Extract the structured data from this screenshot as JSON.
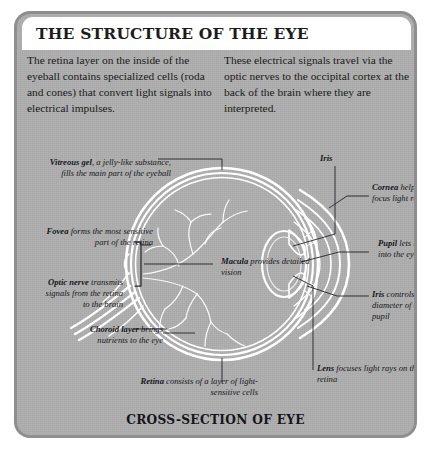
{
  "panel": {
    "title": "THE STRUCTURE OF THE EYE",
    "caption": "CROSS-SECTION OF EYE",
    "bg_color": "#a8a8a8",
    "border_color": "#8e8e8e",
    "title_bar_color": "#ffffff",
    "text_color": "#1a1a1a",
    "diagram_line_color": "#ffffff"
  },
  "intro": {
    "left": "The retina layer on the inside of the eyeball contains specialized cells (roda and cones) that convert light signals into electrical impulses.",
    "right": "These electrical signals travel via the optic nerves to the occipital cortex at the back of the brain where they are interpreted."
  },
  "labels": {
    "vitreous": {
      "term": "Vitreous gel",
      "text": ", a jelly-like substance, fills the main part of the eyeball"
    },
    "fovea": {
      "term": "Fovea",
      "text": " forms the most sensitive part of the retina"
    },
    "optic": {
      "term": "Optic nerve",
      "text": " transmits signals from the retina to the brain"
    },
    "choroid": {
      "term": "Choroid layer",
      "text": " brings nutrients to the eye"
    },
    "retina": {
      "term": "Retina",
      "text": " consists of a layer of light-sensitive cells"
    },
    "macula": {
      "term": "Macula",
      "text": " provides detailed vision"
    },
    "iris_top": {
      "term": "Iris",
      "text": ""
    },
    "cornea": {
      "term": "Cornea",
      "text": " helps to focus light rays"
    },
    "pupil": {
      "term": "Pupil",
      "text": " lets light into the eye"
    },
    "iris_ctrl": {
      "term": "Iris",
      "text": " controls the diameter of the pupil"
    },
    "lens": {
      "term": "Lens",
      "text": " focuses light rays on the retina"
    }
  }
}
